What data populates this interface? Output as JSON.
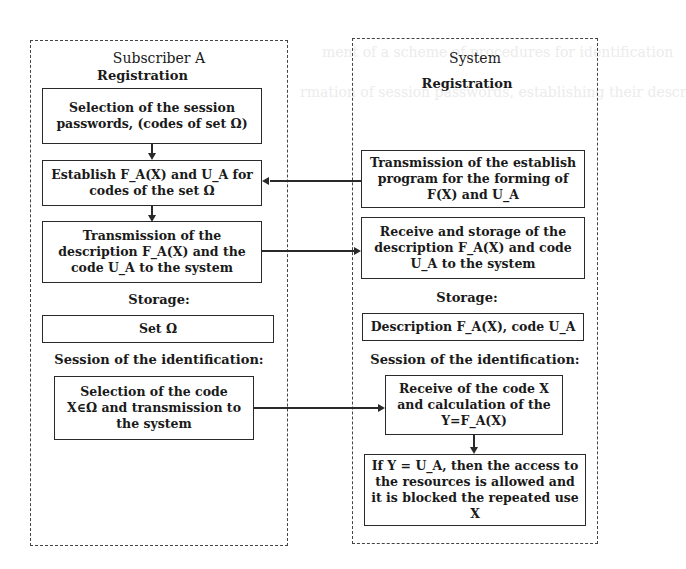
{
  "background_text": [
    "ment of a scheme of procedures for identification",
    "rmation of session passwords, establishing their descr"
  ],
  "subscriber": {
    "title": "Subscriber A",
    "registration_heading": "Registration",
    "box_selection_l1": "Selection of the session",
    "box_selection_l2": "passwords, (codes of set Ω)",
    "box_establish_l1": "Establish F_A(X) and U_A for",
    "box_establish_l2": "codes of the set Ω",
    "box_transmission_l1": "Transmission of the",
    "box_transmission_l2": "description F_A(X) and the",
    "box_transmission_l3": "code U_A to the system",
    "storage_heading": "Storage:",
    "box_storage": "Set Ω",
    "session_heading": "Session of the identification:",
    "box_code_l1": "Selection of the code",
    "box_code_l2": "X∈Ω  and transmission to",
    "box_code_l3": "the system"
  },
  "system": {
    "title": "System",
    "registration_heading": "Registration",
    "box_program_l1": "Transmission of the establish",
    "box_program_l2": "program for the forming of",
    "box_program_l3": "F(X) and U_A",
    "box_receive_l1": "Receive and storage of the",
    "box_receive_l2": "description F_A(X) and code",
    "box_receive_l3": "U_A to the system",
    "storage_heading": "Storage:",
    "box_storage": "Description F_A(X), code U_A",
    "session_heading": "Session of the identification:",
    "box_calc_l1": "Receive of the code X",
    "box_calc_l2": "and calculation of the",
    "box_calc_l3": "Y=F_A(X)",
    "box_access_l1": "If Y = U_A, then the access to",
    "box_access_l2": "the resources is allowed and",
    "box_access_l3": "it is blocked the repeated use",
    "box_access_l4": "X"
  }
}
